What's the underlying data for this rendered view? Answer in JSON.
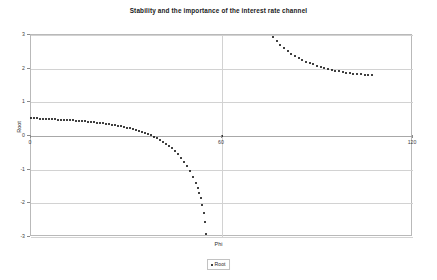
{
  "chart_data": {
    "type": "scatter",
    "title": "Stability and the importance of the interest rate channel",
    "xlabel": "Phi",
    "ylabel": "Root",
    "xlim": [
      0,
      120
    ],
    "ylim": [
      -3,
      3
    ],
    "xticks": [
      0,
      60,
      120
    ],
    "yticks": [
      3,
      2,
      1,
      0,
      -1,
      -2,
      -3
    ],
    "grid": true,
    "legend_position": "bottom-center",
    "legend": [
      "Root"
    ],
    "marker": "dot",
    "marker_color": "#000000",
    "series": [
      {
        "name": "Root",
        "points": [
          [
            0.0,
            0.52
          ],
          [
            0.9,
            0.52
          ],
          [
            1.9,
            0.52
          ],
          [
            2.8,
            0.51
          ],
          [
            3.8,
            0.51
          ],
          [
            4.7,
            0.51
          ],
          [
            5.7,
            0.5
          ],
          [
            6.6,
            0.5
          ],
          [
            7.5,
            0.5
          ],
          [
            8.5,
            0.49
          ],
          [
            9.4,
            0.49
          ],
          [
            10.4,
            0.48
          ],
          [
            11.3,
            0.48
          ],
          [
            12.3,
            0.47
          ],
          [
            13.2,
            0.47
          ],
          [
            14.1,
            0.46
          ],
          [
            15.1,
            0.45
          ],
          [
            16.0,
            0.45
          ],
          [
            17.0,
            0.44
          ],
          [
            17.9,
            0.43
          ],
          [
            18.9,
            0.42
          ],
          [
            19.8,
            0.41
          ],
          [
            20.7,
            0.4
          ],
          [
            21.7,
            0.39
          ],
          [
            22.6,
            0.38
          ],
          [
            23.6,
            0.37
          ],
          [
            24.5,
            0.35
          ],
          [
            25.5,
            0.34
          ],
          [
            26.4,
            0.32
          ],
          [
            27.3,
            0.31
          ],
          [
            28.3,
            0.29
          ],
          [
            29.2,
            0.27
          ],
          [
            30.2,
            0.25
          ],
          [
            31.1,
            0.23
          ],
          [
            32.1,
            0.21
          ],
          [
            33.0,
            0.18
          ],
          [
            33.9,
            0.15
          ],
          [
            34.9,
            0.12
          ],
          [
            35.8,
            0.09
          ],
          [
            36.8,
            0.06
          ],
          [
            37.7,
            0.02
          ],
          [
            38.7,
            -0.02
          ],
          [
            39.6,
            -0.07
          ],
          [
            40.5,
            -0.12
          ],
          [
            41.5,
            -0.17
          ],
          [
            42.4,
            -0.23
          ],
          [
            43.4,
            -0.3
          ],
          [
            44.3,
            -0.37
          ],
          [
            45.3,
            -0.45
          ],
          [
            46.2,
            -0.54
          ],
          [
            47.1,
            -0.64
          ],
          [
            48.1,
            -0.76
          ],
          [
            49.0,
            -0.89
          ],
          [
            50.0,
            -1.04
          ],
          [
            50.9,
            -1.21
          ],
          [
            51.9,
            -1.41
          ],
          [
            52.4,
            -1.54
          ],
          [
            52.8,
            -1.68
          ],
          [
            53.3,
            -1.85
          ],
          [
            53.8,
            -2.05
          ],
          [
            54.2,
            -2.28
          ],
          [
            54.6,
            -2.56
          ],
          [
            55.0,
            -2.9
          ]
        ]
      },
      {
        "name": "Root",
        "points": [
          [
            60.0,
            0.0
          ]
        ]
      },
      {
        "name": "Root",
        "points": [
          [
            76.0,
            2.95
          ],
          [
            77.2,
            2.82
          ],
          [
            78.3,
            2.71
          ],
          [
            79.5,
            2.61
          ],
          [
            80.6,
            2.53
          ],
          [
            81.8,
            2.45
          ],
          [
            82.9,
            2.38
          ],
          [
            84.1,
            2.32
          ],
          [
            85.2,
            2.26
          ],
          [
            86.4,
            2.21
          ],
          [
            87.5,
            2.17
          ],
          [
            88.7,
            2.13
          ],
          [
            89.8,
            2.09
          ],
          [
            91.0,
            2.05
          ],
          [
            92.1,
            2.02
          ],
          [
            93.3,
            1.99
          ],
          [
            94.4,
            1.96
          ],
          [
            95.6,
            1.94
          ],
          [
            96.7,
            1.92
          ],
          [
            97.9,
            1.9
          ],
          [
            99.0,
            1.88
          ],
          [
            100.2,
            1.86
          ],
          [
            101.3,
            1.85
          ],
          [
            102.5,
            1.84
          ],
          [
            103.6,
            1.83
          ],
          [
            104.8,
            1.82
          ],
          [
            105.9,
            1.82
          ],
          [
            107.1,
            1.81
          ]
        ]
      }
    ]
  },
  "legend": {
    "entry_label": "Root"
  },
  "axis": {
    "y_title": "Root",
    "x_title": "Phi"
  }
}
